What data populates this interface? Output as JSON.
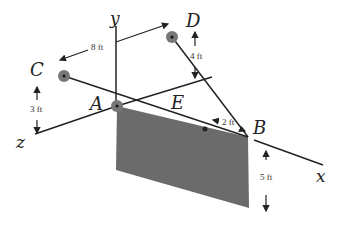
{
  "diagram": {
    "type": "3D statics diagram",
    "axes": {
      "x": "x",
      "y": "y",
      "z": "z"
    },
    "points": {
      "A": "A",
      "B": "B",
      "C": "C",
      "D": "D",
      "E": "E"
    },
    "dimensions": {
      "ac_horizontal": "8 ft",
      "c_height": "3 ft",
      "d_height": "4 ft",
      "e_to_b": "2 ft",
      "plate_height": "5 ft"
    },
    "colors": {
      "plate": "#6b6b6b",
      "line": "#222222",
      "pin": "#777777"
    }
  }
}
